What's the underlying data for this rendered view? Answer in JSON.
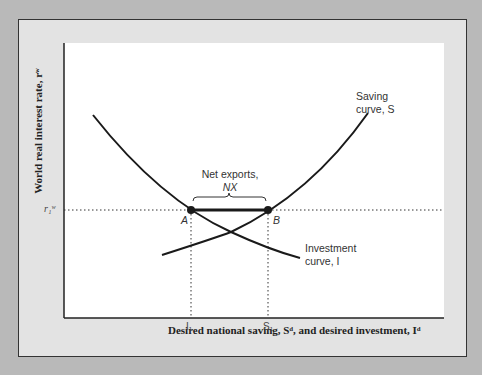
{
  "axes": {
    "ylabel": "World real interest rate, rʷ",
    "xlabel": "Desired national saving, Sᵈ, and desired investment, Iᵈ",
    "y_tick": "r₁ʷ",
    "x_ticks": [
      "I₁",
      "S₁"
    ]
  },
  "labels": {
    "saving_curve": [
      "Saving",
      "curve, S"
    ],
    "investment_curve": [
      "Investment",
      "curve, I"
    ],
    "net_exports": [
      "Net exports,",
      "NX"
    ],
    "point_a": "A",
    "point_b": "B"
  },
  "colors": {
    "curve": "#1a1a1a",
    "background": "#b9b9b9",
    "panel": "#e3e3e3"
  }
}
